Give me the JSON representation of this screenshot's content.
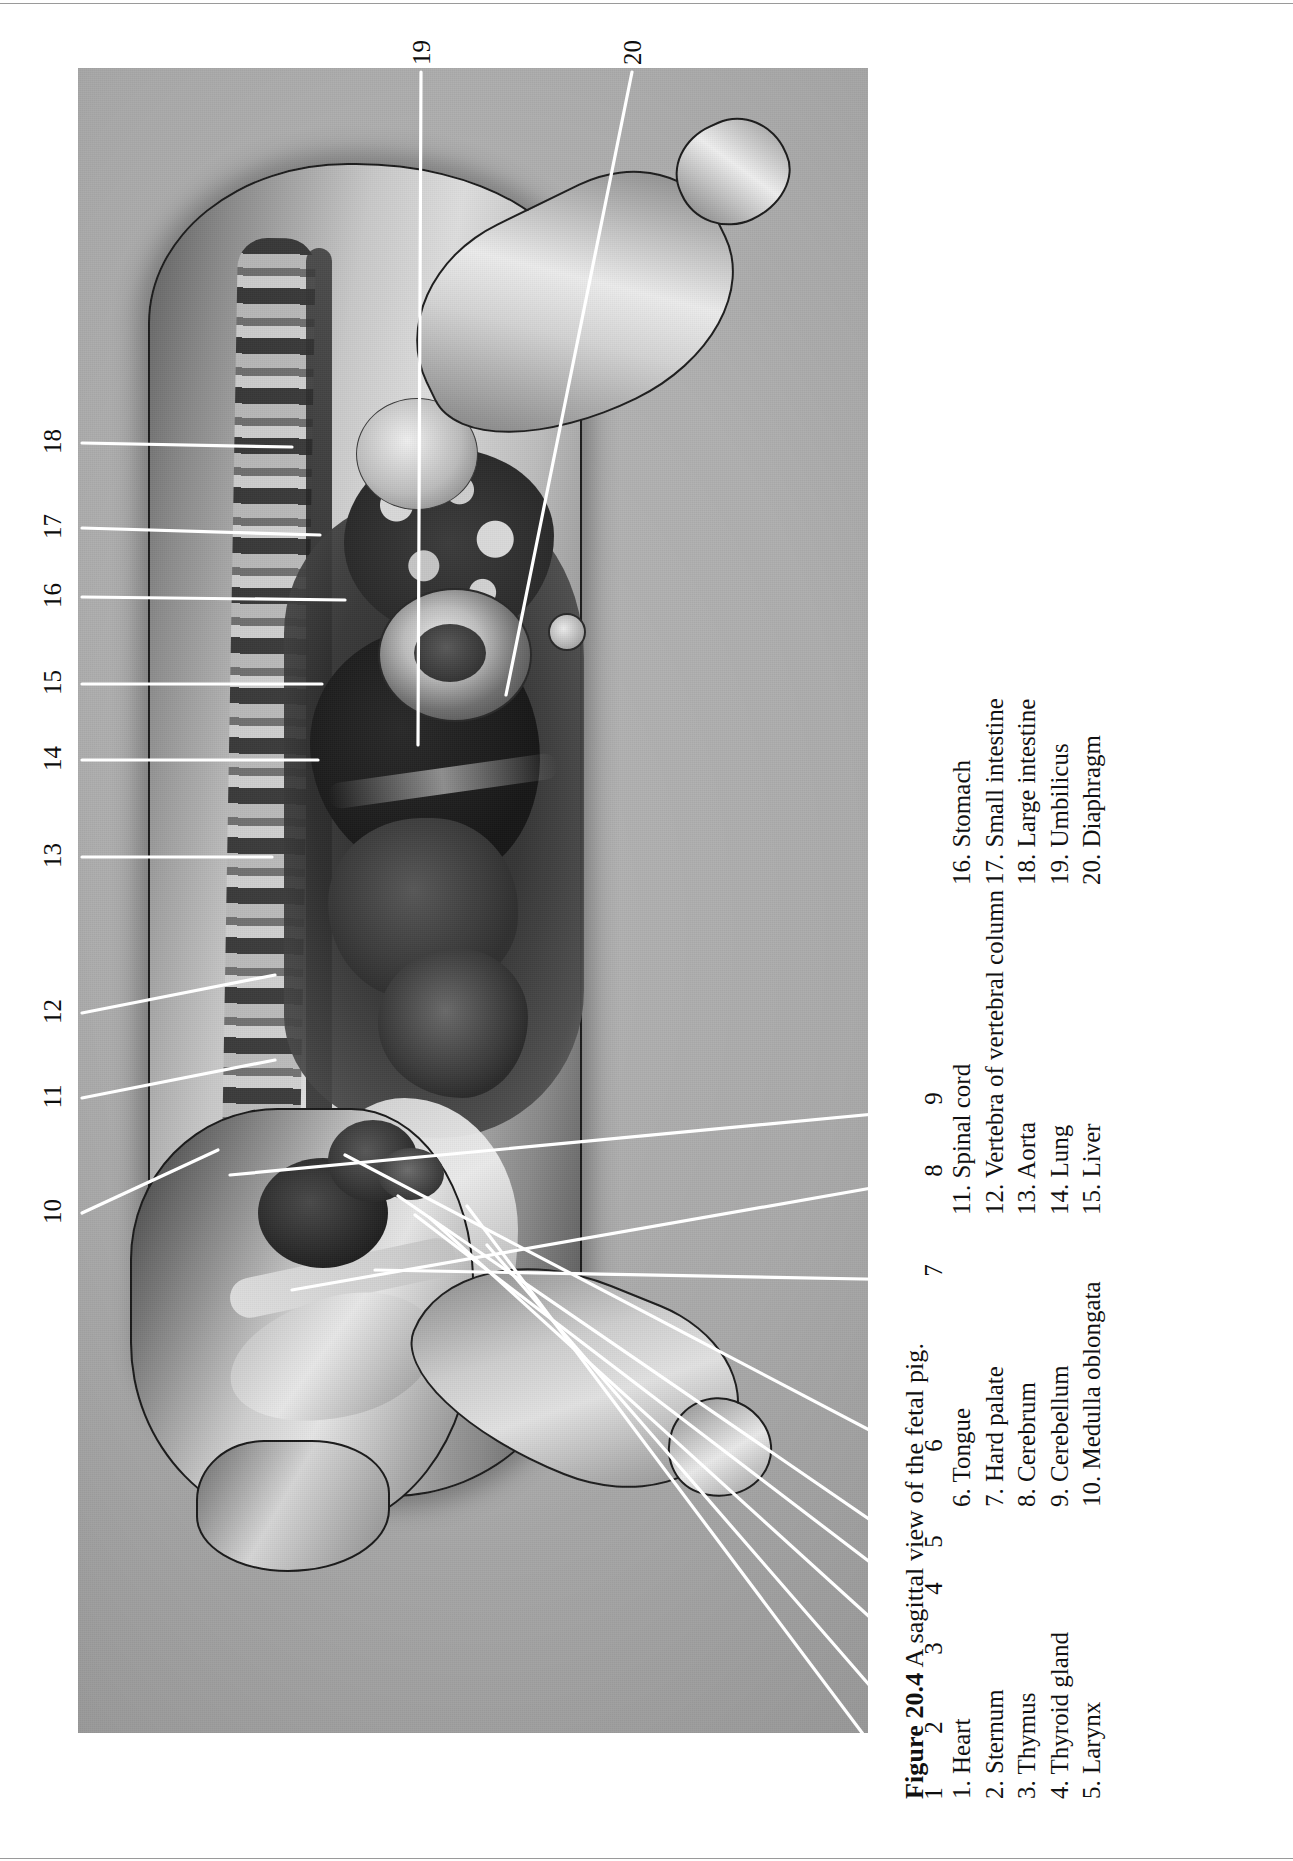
{
  "figure": {
    "number_label": "Figure 20.4",
    "caption": "A sagittal view of the fetal pig."
  },
  "legend": {
    "columns": [
      {
        "items": [
          {
            "num": "1.",
            "label": "Heart"
          },
          {
            "num": "2.",
            "label": "Sternum"
          },
          {
            "num": "3.",
            "label": "Thymus"
          },
          {
            "num": "4.",
            "label": "Thyroid gland"
          },
          {
            "num": "5.",
            "label": "Larynx"
          }
        ]
      },
      {
        "items": [
          {
            "num": "6.",
            "label": "Tongue"
          },
          {
            "num": "7.",
            "label": "Hard palate"
          },
          {
            "num": "8.",
            "label": "Cerebrum"
          },
          {
            "num": "9.",
            "label": "Cerebellum"
          },
          {
            "num": "10.",
            "label": "Medulla oblongata"
          }
        ]
      },
      {
        "items": [
          {
            "num": "11.",
            "label": "Spinal cord"
          },
          {
            "num": "12.",
            "label": "Vertebra of vertebral column"
          },
          {
            "num": "13.",
            "label": "Aorta"
          },
          {
            "num": "14.",
            "label": "Lung"
          },
          {
            "num": "15.",
            "label": "Liver"
          }
        ]
      },
      {
        "items": [
          {
            "num": "16.",
            "label": "Stomach"
          },
          {
            "num": "17.",
            "label": "Small intestine"
          },
          {
            "num": "18.",
            "label": "Large intestine"
          },
          {
            "num": "19.",
            "label": "Umbilicus"
          },
          {
            "num": "20.",
            "label": "Diaphragm"
          }
        ]
      }
    ]
  },
  "callouts": [
    {
      "id": "1",
      "text": "1",
      "x": 933,
      "y": 1795
    },
    {
      "id": "2",
      "text": "2",
      "x": 933,
      "y": 1729
    },
    {
      "id": "3",
      "text": "3",
      "x": 933,
      "y": 1650
    },
    {
      "id": "4",
      "text": "4",
      "x": 933,
      "y": 1590
    },
    {
      "id": "5",
      "text": "5",
      "x": 933,
      "y": 1543
    },
    {
      "id": "6",
      "text": "6",
      "x": 933,
      "y": 1447
    },
    {
      "id": "7",
      "text": "7",
      "x": 933,
      "y": 1272
    },
    {
      "id": "8",
      "text": "8",
      "x": 933,
      "y": 1172
    },
    {
      "id": "9",
      "text": "9",
      "x": 933,
      "y": 1100
    },
    {
      "id": "10",
      "text": "10",
      "x": 52,
      "y": 1213
    },
    {
      "id": "11",
      "text": "11",
      "x": 52,
      "y": 1098
    },
    {
      "id": "12",
      "text": "12",
      "x": 52,
      "y": 1013
    },
    {
      "id": "13",
      "text": "13",
      "x": 52,
      "y": 857
    },
    {
      "id": "14",
      "text": "14",
      "x": 52,
      "y": 760
    },
    {
      "id": "15",
      "text": "15",
      "x": 52,
      "y": 684
    },
    {
      "id": "16",
      "text": "16",
      "x": 52,
      "y": 597
    },
    {
      "id": "17",
      "text": "17",
      "x": 52,
      "y": 528
    },
    {
      "id": "18",
      "text": "18",
      "x": 52,
      "y": 443
    },
    {
      "id": "19",
      "text": "19",
      "x": 421,
      "y": 54
    },
    {
      "id": "20",
      "text": "20",
      "x": 632,
      "y": 54
    }
  ],
  "leader_lines": [
    {
      "id": "1",
      "x1": 917,
      "y1": 1806,
      "x2": 467,
      "y2": 1206
    },
    {
      "id": "2",
      "x1": 917,
      "y1": 1740,
      "x2": 487,
      "y2": 1245
    },
    {
      "id": "3",
      "x1": 917,
      "y1": 1660,
      "x2": 430,
      "y2": 1218
    },
    {
      "id": "4",
      "x1": 917,
      "y1": 1598,
      "x2": 415,
      "y2": 1215
    },
    {
      "id": "5",
      "x1": 917,
      "y1": 1552,
      "x2": 398,
      "y2": 1196
    },
    {
      "id": "6",
      "x1": 917,
      "y1": 1455,
      "x2": 345,
      "y2": 1155
    },
    {
      "id": "7",
      "x1": 917,
      "y1": 1280,
      "x2": 375,
      "y2": 1270
    },
    {
      "id": "8",
      "x1": 917,
      "y1": 1180,
      "x2": 292,
      "y2": 1290
    },
    {
      "id": "9",
      "x1": 917,
      "y1": 1110,
      "x2": 230,
      "y2": 1175
    },
    {
      "id": "10",
      "x1": 82,
      "y1": 1213,
      "x2": 218,
      "y2": 1150
    },
    {
      "id": "11",
      "x1": 82,
      "y1": 1098,
      "x2": 275,
      "y2": 1060
    },
    {
      "id": "12",
      "x1": 82,
      "y1": 1013,
      "x2": 275,
      "y2": 975
    },
    {
      "id": "13",
      "x1": 82,
      "y1": 857,
      "x2": 272,
      "y2": 857
    },
    {
      "id": "14",
      "x1": 82,
      "y1": 760,
      "x2": 318,
      "y2": 760
    },
    {
      "id": "15",
      "x1": 82,
      "y1": 684,
      "x2": 322,
      "y2": 684
    },
    {
      "id": "16",
      "x1": 82,
      "y1": 597,
      "x2": 345,
      "y2": 600
    },
    {
      "id": "17",
      "x1": 82,
      "y1": 528,
      "x2": 320,
      "y2": 535
    },
    {
      "id": "18",
      "x1": 82,
      "y1": 443,
      "x2": 292,
      "y2": 447
    },
    {
      "id": "19",
      "x1": 421,
      "y1": 72,
      "x2": 418,
      "y2": 745
    },
    {
      "id": "20",
      "x1": 632,
      "y1": 72,
      "x2": 506,
      "y2": 695
    }
  ],
  "colors": {
    "plate_background": "#b0b0b0",
    "leader_line": "#ffffff",
    "text": "#111111",
    "page_background": "#ffffff"
  }
}
